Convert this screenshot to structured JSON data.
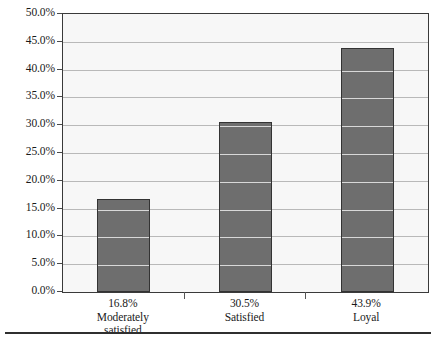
{
  "chart_data": {
    "type": "bar",
    "title": "",
    "subtitle": "",
    "xlabel": "",
    "ylabel": "",
    "categories": [
      "Moderately satisfied",
      "Satisfied",
      "Loyal"
    ],
    "category_lines": [
      [
        "Moderately",
        "satisfied"
      ],
      [
        "Satisfied"
      ],
      [
        "Loyal"
      ]
    ],
    "values": [
      16.8,
      30.5,
      43.9
    ],
    "value_labels": [
      "16.8%",
      "30.5%",
      "43.9%"
    ],
    "ylim": [
      0,
      50
    ],
    "ytick_step": 5,
    "ytick_labels": [
      "50.0%",
      "45.0%",
      "40.0%",
      "35.0%",
      "30.0%",
      "25.0%",
      "20.0%",
      "15.0%",
      "10.0%",
      "5.0%",
      "0.0%"
    ],
    "ytick_values": [
      50,
      45,
      40,
      35,
      30,
      25,
      20,
      15,
      10,
      5,
      0
    ],
    "grid": true,
    "grid_axis": "y",
    "legend": false,
    "legend_position": "none",
    "series": [
      {
        "name": "Percent of customers",
        "values": [
          16.8,
          30.5,
          43.9
        ]
      }
    ],
    "colors": {
      "bar_fill": "#6e6e6e",
      "bar_border": "#333333",
      "plot_background": "#f7f7f7",
      "gridline": "#b9b9b9",
      "frame": "#3a3a3a",
      "text": "#1a1a1a",
      "rule": "#2f2f2f"
    }
  }
}
